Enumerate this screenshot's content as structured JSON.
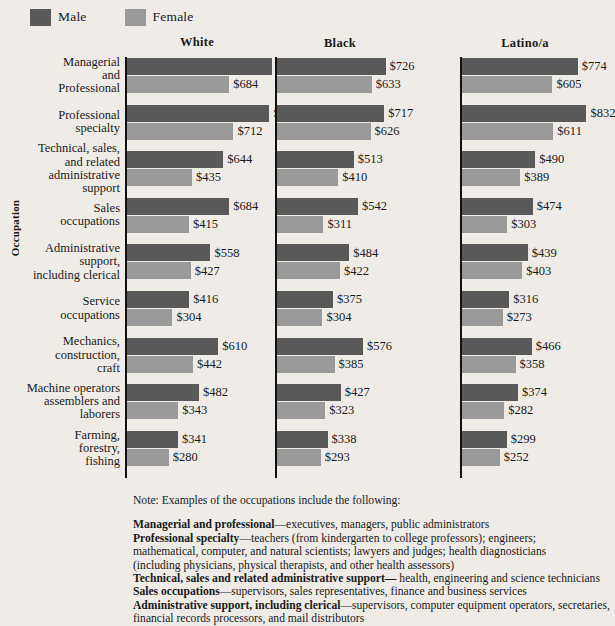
{
  "legend": {
    "items": [
      {
        "label": "Male",
        "color": "#595959",
        "icon": "legend-swatch-male"
      },
      {
        "label": "Female",
        "color": "#9a9a9a",
        "icon": "legend-swatch-female"
      }
    ]
  },
  "axis": {
    "y_title": "Occupation"
  },
  "chart_data": {
    "type": "bar",
    "orientation": "horizontal",
    "title": "",
    "xlabel": "",
    "ylabel": "Occupation",
    "grid": false,
    "legend_position": "top-left",
    "value_prefix": "$",
    "xlim": [
      0,
      1000
    ],
    "panels": [
      "White",
      "Black",
      "Latino/a"
    ],
    "categories": [
      "Managerial and Professional",
      "Professional specialty",
      "Technical, sales, and related administrative support",
      "Sales occupations",
      "Administrative support, including clerical",
      "Service occupations",
      "Mechanics, construction, craft",
      "Machine operators assemblers and laborers",
      "Farming, forestry, fishing"
    ],
    "category_label_lines": [
      [
        "Managerial",
        "and",
        "Professional"
      ],
      [
        "Professional",
        "specialty"
      ],
      [
        "Technical, sales,",
        "and related",
        "administrative",
        "support"
      ],
      [
        "Sales",
        "occupations"
      ],
      [
        "Administrative",
        "support,",
        "including clerical"
      ],
      [
        "Service",
        "occupations"
      ],
      [
        "Mechanics,",
        "construction,",
        "craft"
      ],
      [
        "Machine operators",
        "assemblers and",
        "laborers"
      ],
      [
        "Farming,",
        "forestry,",
        "fishing"
      ]
    ],
    "series": [
      {
        "panel": "White",
        "male": [
          968,
          953,
          644,
          684,
          558,
          416,
          610,
          482,
          341
        ],
        "female": [
          684,
          712,
          435,
          415,
          427,
          304,
          442,
          343,
          280
        ],
        "male_labels": [
          "$968",
          "$953",
          "$644",
          "$684",
          "$558",
          "$416",
          "$610",
          "$482",
          "$341"
        ],
        "female_labels": [
          "$684",
          "$712",
          "$435",
          "$415",
          "$427",
          "$304",
          "$442",
          "$343",
          "$280"
        ]
      },
      {
        "panel": "Black",
        "male": [
          726,
          717,
          513,
          542,
          484,
          375,
          576,
          427,
          338
        ],
        "female": [
          633,
          626,
          410,
          311,
          422,
          304,
          385,
          323,
          293
        ],
        "male_labels": [
          "$726",
          "$717",
          "$513",
          "$542",
          "$484",
          "$375",
          "$576",
          "$427",
          "$338"
        ],
        "female_labels": [
          "$633",
          "$626",
          "$410",
          "$311",
          "$422",
          "$304",
          "$385",
          "$323",
          "$293"
        ]
      },
      {
        "panel": "Latino/a",
        "male": [
          774,
          832,
          490,
          474,
          439,
          316,
          466,
          374,
          299
        ],
        "female": [
          605,
          611,
          389,
          303,
          403,
          273,
          358,
          282,
          252
        ],
        "male_labels": [
          "$774",
          "$832",
          "$490",
          "$474",
          "$439",
          "$316",
          "$466",
          "$374",
          "$299"
        ],
        "female_labels": [
          "$605",
          "$611",
          "$389",
          "$303",
          "$403",
          "$273",
          "$358",
          "$282",
          "$252"
        ]
      }
    ]
  },
  "note": {
    "heading": "Note: Examples of the occupations include the following:",
    "entries": [
      {
        "term": "Managerial and professional",
        "dash": "—",
        "text": "executives, managers, public administrators"
      },
      {
        "term": "Professional specialty",
        "dash": "—",
        "text": "teachers (from kindergarten to college professors); engineers;"
      },
      {
        "term": "",
        "dash": "",
        "text": "mathematical, computer, and natural scientists; lawyers and judges; health diagnosticians"
      },
      {
        "term": "",
        "dash": "",
        "text": "(including physicians, physical therapists, and other health assessors)"
      },
      {
        "term": "Technical, sales and related administrative support—",
        "dash": "",
        "text": " health, engineering and science technicians"
      },
      {
        "term": "Sales occupations",
        "dash": "—",
        "text": "supervisors, sales representatives, finance and business services"
      },
      {
        "term": "Administrative support, including clerical",
        "dash": "—",
        "text": "supervisors, computer equipment operators, secretaries,"
      },
      {
        "term": "",
        "dash": "",
        "text": "financial records processors, and mail distributors"
      }
    ]
  }
}
